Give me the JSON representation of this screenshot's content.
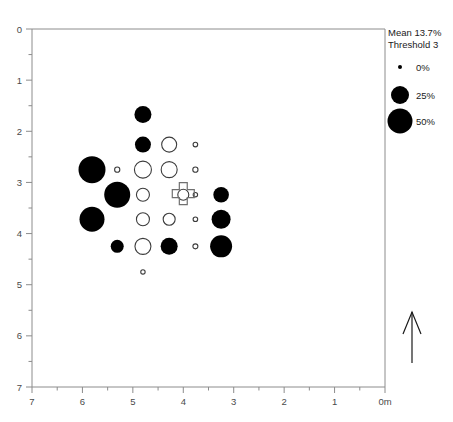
{
  "figure": {
    "name": "survey-bubble-plot",
    "background": "#ffffff",
    "width": 453,
    "height": 422
  },
  "plot_area": {
    "left": 32,
    "top": 29,
    "right": 385,
    "bottom": 387
  },
  "legend": {
    "mean_label": "Mean 13.7%",
    "threshold_label": "Threshold 3",
    "entries": [
      {
        "label": "0%",
        "radius": 2.0
      },
      {
        "label": "25%",
        "radius": 9.0
      },
      {
        "label": "50%",
        "radius": 12.5
      }
    ]
  },
  "north_arrow": {
    "name": "north-arrow",
    "x": 412,
    "y_top": 312,
    "y_bottom": 363
  },
  "site_marker": {
    "name": "site-cross-marker",
    "x_m": 4.0,
    "y_m": 3.22,
    "size": 11
  },
  "chart_data": {
    "type": "scatter",
    "title": "",
    "xlabel": "0m",
    "ylabel": "",
    "xlim": [
      7,
      0
    ],
    "ylim": [
      7,
      0
    ],
    "x_reversed": true,
    "y_reversed": true,
    "grid": false,
    "legend_position": "top-right",
    "x_ticks": [
      "7",
      "6",
      "5",
      "4",
      "3",
      "2",
      "1",
      "0m"
    ],
    "x_tick_values": [
      7,
      6,
      5,
      4,
      3,
      2,
      1,
      0
    ],
    "y_ticks": [
      "0",
      "1",
      "2",
      "3",
      "4",
      "5",
      "6",
      "7"
    ],
    "y_tick_values": [
      0,
      1,
      2,
      3,
      4,
      5,
      6,
      7
    ],
    "minor_tick_step": 0.5,
    "size_legend": {
      "unit": "%",
      "values": [
        0,
        25,
        50
      ]
    },
    "points": [
      {
        "x": 4.8,
        "y": 1.67,
        "value": 25,
        "radius": 8.5,
        "style": "filled"
      },
      {
        "x": 4.8,
        "y": 2.26,
        "value": 23,
        "radius": 8.0,
        "style": "filled"
      },
      {
        "x": 4.28,
        "y": 2.26,
        "value": 10,
        "radius": 7.5,
        "style": "open"
      },
      {
        "x": 3.76,
        "y": 2.26,
        "value": 1,
        "radius": 2.3,
        "style": "open"
      },
      {
        "x": 5.81,
        "y": 2.75,
        "value": 45,
        "radius": 13.5,
        "style": "filled"
      },
      {
        "x": 5.31,
        "y": 2.75,
        "value": 2,
        "radius": 2.6,
        "style": "open"
      },
      {
        "x": 4.8,
        "y": 2.75,
        "value": 12,
        "radius": 8.5,
        "style": "open"
      },
      {
        "x": 4.28,
        "y": 2.75,
        "value": 11,
        "radius": 8.0,
        "style": "open"
      },
      {
        "x": 3.76,
        "y": 2.75,
        "value": 2,
        "radius": 2.6,
        "style": "open"
      },
      {
        "x": 5.31,
        "y": 3.24,
        "value": 42,
        "radius": 13.0,
        "style": "filled"
      },
      {
        "x": 4.8,
        "y": 3.24,
        "value": 8,
        "radius": 6.5,
        "style": "open"
      },
      {
        "x": 4.0,
        "y": 3.24,
        "value": 6,
        "radius": 5.5,
        "style": "open"
      },
      {
        "x": 3.76,
        "y": 3.24,
        "value": 1,
        "radius": 2.2,
        "style": "open"
      },
      {
        "x": 3.25,
        "y": 3.24,
        "value": 22,
        "radius": 7.8,
        "style": "filled"
      },
      {
        "x": 5.81,
        "y": 3.72,
        "value": 40,
        "radius": 12.5,
        "style": "filled"
      },
      {
        "x": 4.8,
        "y": 3.72,
        "value": 8,
        "radius": 6.5,
        "style": "open"
      },
      {
        "x": 4.28,
        "y": 3.72,
        "value": 7,
        "radius": 6.0,
        "style": "open"
      },
      {
        "x": 3.76,
        "y": 3.72,
        "value": 1,
        "radius": 2.3,
        "style": "open"
      },
      {
        "x": 3.25,
        "y": 3.72,
        "value": 26,
        "radius": 9.5,
        "style": "filled"
      },
      {
        "x": 5.31,
        "y": 4.25,
        "value": 16,
        "radius": 6.5,
        "style": "filled"
      },
      {
        "x": 4.8,
        "y": 4.25,
        "value": 11,
        "radius": 8.0,
        "style": "open"
      },
      {
        "x": 4.28,
        "y": 4.25,
        "value": 24,
        "radius": 8.5,
        "style": "filled"
      },
      {
        "x": 3.76,
        "y": 4.25,
        "value": 2,
        "radius": 2.5,
        "style": "open"
      },
      {
        "x": 3.25,
        "y": 4.25,
        "value": 32,
        "radius": 11.0,
        "style": "filled"
      },
      {
        "x": 4.8,
        "y": 4.75,
        "value": 1,
        "radius": 2.2,
        "style": "open"
      }
    ]
  }
}
